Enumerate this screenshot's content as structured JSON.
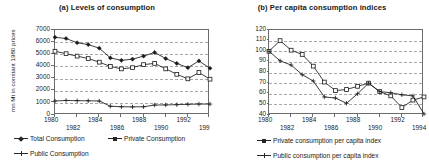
{
  "figure": {
    "panels": [
      {
        "id": "a",
        "title": "(a) Levels of consumption",
        "ylabel": "mn Mt in constant 1980 prices",
        "yticks": [
          "0",
          "1000",
          "2000",
          "3000",
          "4000",
          "5000",
          "6000",
          "7000"
        ],
        "xticks": [
          "1980",
          "1982",
          "1984",
          "1986",
          "1988",
          "1990",
          "1992",
          "199"
        ],
        "legend": [
          {
            "label": "Total Consumption",
            "marker": "diamond-marker-icon"
          },
          {
            "label": "Private Consumption",
            "marker": "square-marker-icon"
          },
          {
            "label": "Public Consumption",
            "marker": "cross-marker-icon"
          }
        ]
      },
      {
        "id": "b",
        "title": "(b) Per capita consumption indices",
        "ylabel": "index (1980=100)",
        "yticks": [
          "40",
          "50",
          "60",
          "70",
          "80",
          "90",
          "100",
          "110",
          "120"
        ],
        "xticks": [
          "1980",
          "1982",
          "1984",
          "1986",
          "1988",
          "1990",
          "1992",
          "1994"
        ],
        "legend": [
          {
            "label": "Private consumption per capita index",
            "marker": "square-marker-icon"
          },
          {
            "label": "Public consumption per capita index",
            "marker": "cross-marker-icon"
          }
        ]
      }
    ]
  },
  "chart_data": [
    {
      "type": "line",
      "title": "(a) Levels of consumption",
      "xlabel": "",
      "ylabel": "mn Mt in constant 1980 prices",
      "x": [
        1980,
        1981,
        1982,
        1983,
        1984,
        1985,
        1986,
        1987,
        1988,
        1989,
        1990,
        1991,
        1992,
        1993,
        1994
      ],
      "xlim": [
        1980,
        1994
      ],
      "ylim": [
        0,
        7000
      ],
      "ytick_step": 1000,
      "grid": true,
      "legend_position": "below",
      "series": [
        {
          "name": "Total Consumption",
          "marker": "diamond",
          "values": [
            6400,
            6300,
            5950,
            5800,
            5500,
            4700,
            4500,
            4600,
            4850,
            5150,
            4650,
            4250,
            3900,
            4450,
            3850
          ]
        },
        {
          "name": "Private Consumption",
          "marker": "square",
          "values": [
            5250,
            5050,
            4850,
            4650,
            4350,
            4000,
            3800,
            3900,
            4150,
            4250,
            3800,
            3350,
            2980,
            3500,
            2950
          ]
        },
        {
          "name": "Public Consumption",
          "marker": "cross",
          "values": [
            1150,
            1200,
            1180,
            1170,
            1150,
            720,
            680,
            670,
            680,
            820,
            830,
            850,
            880,
            900,
            900
          ]
        }
      ]
    },
    {
      "type": "line",
      "title": "(b) Per capita consumption indices",
      "xlabel": "",
      "ylabel": "index (1980=100)",
      "x": [
        1980,
        1981,
        1982,
        1983,
        1984,
        1985,
        1986,
        1987,
        1988,
        1989,
        1990,
        1991,
        1992,
        1993,
        1994
      ],
      "xlim": [
        1980,
        1994
      ],
      "ylim": [
        40,
        120
      ],
      "ytick_step": 10,
      "grid": true,
      "legend_position": "below",
      "series": [
        {
          "name": "Private consumption per capita index",
          "marker": "square",
          "values": [
            100,
            110,
            101,
            97,
            86,
            71,
            63,
            64,
            67,
            70,
            62,
            58,
            47,
            54,
            57
          ]
        },
        {
          "name": "Public consumption per capita index",
          "marker": "cross",
          "values": [
            100,
            91,
            87,
            78,
            72,
            57,
            56,
            51,
            60,
            70,
            62,
            61,
            59,
            58,
            41
          ]
        }
      ]
    }
  ]
}
